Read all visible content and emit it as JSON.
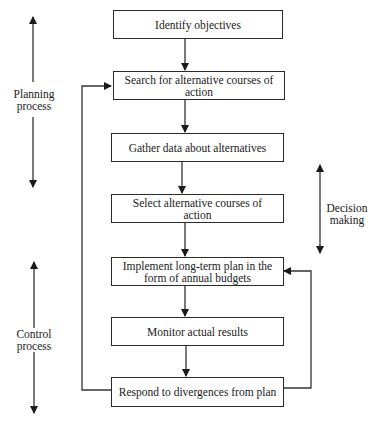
{
  "flow_steps": [
    {
      "id": "identify",
      "label": "Identify objectives"
    },
    {
      "id": "search",
      "label": "Search for alternative courses of action"
    },
    {
      "id": "gather",
      "label": "Gather data about alternatives"
    },
    {
      "id": "select",
      "label": "Select alternative courses of action"
    },
    {
      "id": "implement",
      "label": "Implement long-term plan in the form of annual budgets"
    },
    {
      "id": "monitor",
      "label": "Monitor actual results"
    },
    {
      "id": "respond",
      "label": "Respond to divergences from plan"
    }
  ],
  "side_labels": {
    "planning": "Planning process",
    "decision": "Decision making",
    "control": "Control process"
  },
  "feedback_loops": [
    {
      "from": "respond",
      "to": "search",
      "side": "left"
    },
    {
      "from": "respond",
      "to": "implement",
      "side": "right"
    }
  ]
}
